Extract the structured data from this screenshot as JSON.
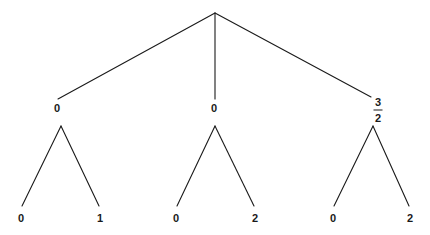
{
  "diagram": {
    "type": "tree",
    "background_color": "#ffffff",
    "line_color": "#1a1a1a",
    "text_color": "#1a1a1a",
    "root": {
      "name": "root-node",
      "label": "",
      "x": 215,
      "y": 13
    },
    "level1": [
      {
        "name": "node-left",
        "label": "0",
        "x": 57,
        "y": 108,
        "line_end_x": 58,
        "line_end_y": 99
      },
      {
        "name": "node-middle",
        "label": "0",
        "x": 214,
        "y": 108,
        "line_end_x": 215,
        "line_end_y": 99
      },
      {
        "name": "node-right",
        "label": "3/2",
        "numerator": "3",
        "denominator": "2",
        "x": 378,
        "y": 110,
        "line_end_x": 371,
        "line_end_y": 97
      }
    ],
    "branch_apexes": [
      {
        "name": "apex-left",
        "x": 61,
        "y": 126
      },
      {
        "name": "apex-middle",
        "x": 215,
        "y": 126
      },
      {
        "name": "apex-right",
        "x": 373,
        "y": 126
      }
    ],
    "leaves": [
      {
        "name": "leaf-1",
        "label": "0",
        "x": 21,
        "y": 218,
        "line_end_x": 22,
        "line_end_y": 206
      },
      {
        "name": "leaf-2",
        "label": "1",
        "x": 100,
        "y": 218,
        "line_end_x": 99,
        "line_end_y": 206
      },
      {
        "name": "leaf-3",
        "label": "0",
        "x": 176,
        "y": 218,
        "line_end_x": 177,
        "line_end_y": 206
      },
      {
        "name": "leaf-4",
        "label": "2",
        "x": 255,
        "y": 218,
        "line_end_x": 254,
        "line_end_y": 206
      },
      {
        "name": "leaf-5",
        "label": "0",
        "x": 333,
        "y": 218,
        "line_end_x": 334,
        "line_end_y": 206
      },
      {
        "name": "leaf-6",
        "label": "2",
        "x": 410,
        "y": 218,
        "line_end_x": 409,
        "line_end_y": 206
      }
    ],
    "edges": [
      {
        "name": "edge-root-left",
        "x1": 215,
        "y1": 13,
        "x2": 58,
        "y2": 99
      },
      {
        "name": "edge-root-middle",
        "x1": 215,
        "y1": 13,
        "x2": 215,
        "y2": 99
      },
      {
        "name": "edge-root-right",
        "x1": 215,
        "y1": 13,
        "x2": 371,
        "y2": 97
      },
      {
        "name": "edge-left-leaf1",
        "x1": 61,
        "y1": 126,
        "x2": 22,
        "y2": 206
      },
      {
        "name": "edge-left-leaf2",
        "x1": 61,
        "y1": 126,
        "x2": 99,
        "y2": 206
      },
      {
        "name": "edge-mid-leaf1",
        "x1": 215,
        "y1": 126,
        "x2": 177,
        "y2": 206
      },
      {
        "name": "edge-mid-leaf2",
        "x1": 215,
        "y1": 126,
        "x2": 254,
        "y2": 206
      },
      {
        "name": "edge-right-leaf1",
        "x1": 373,
        "y1": 126,
        "x2": 334,
        "y2": 206
      },
      {
        "name": "edge-right-leaf2",
        "x1": 373,
        "y1": 126,
        "x2": 409,
        "y2": 206
      }
    ]
  }
}
